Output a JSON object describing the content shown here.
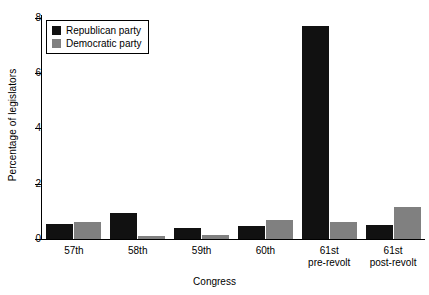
{
  "chart_data": {
    "type": "bar",
    "title": "",
    "xlabel": "Congress",
    "ylabel": "Percentage of legislators",
    "categories": [
      "57th",
      "58th",
      "59th",
      "60th",
      "61st pre-revolt",
      "61st post-revolt"
    ],
    "category_lines": [
      [
        "57th"
      ],
      [
        "58th"
      ],
      [
        "59th"
      ],
      [
        "60th"
      ],
      [
        "61st",
        "pre-revolt"
      ],
      [
        "61st",
        "post-revolt"
      ]
    ],
    "series": [
      {
        "name": "Republican party",
        "color": "#111111",
        "values": [
          0.53,
          0.95,
          0.4,
          0.47,
          7.7,
          0.5
        ]
      },
      {
        "name": "Democratic party",
        "color": "#808080",
        "values": [
          0.63,
          0.12,
          0.13,
          0.68,
          0.63,
          1.15
        ]
      }
    ],
    "ylim": [
      0,
      8.1
    ],
    "yticks": [
      0,
      2,
      4,
      6,
      8
    ],
    "ytick_labels": [
      "0",
      "2",
      "4",
      "6",
      "8"
    ],
    "grid": false,
    "legend_position": "upper-left"
  },
  "legend": {
    "entries": [
      {
        "label": "Republican party",
        "swatch": "rep"
      },
      {
        "label": "Democratic party",
        "swatch": "dem"
      }
    ]
  }
}
